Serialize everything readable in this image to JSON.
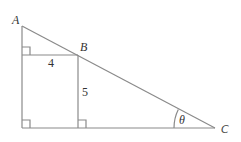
{
  "diagram": {
    "points": {
      "A": {
        "label": "A",
        "x": 22,
        "y": 26
      },
      "B": {
        "label": "B",
        "x": 78,
        "y": 55
      },
      "C": {
        "label": "C",
        "x": 215,
        "y": 128
      },
      "D": {
        "x": 22,
        "y": 128
      },
      "E": {
        "x": 22,
        "y": 55
      },
      "F": {
        "x": 78,
        "y": 128
      }
    },
    "labels": {
      "A": "A",
      "B": "B",
      "C": "C",
      "theta": "θ",
      "side_horizontal": "4",
      "side_vertical": "5"
    },
    "segments": [
      {
        "name": "AC-hypotenuse",
        "from": "A",
        "to": "C"
      },
      {
        "name": "A-to-bottom-left",
        "from": "A",
        "to": "D"
      },
      {
        "name": "base",
        "from": "D",
        "to": "C"
      },
      {
        "name": "rectangle-top",
        "from": "E",
        "to": "B"
      },
      {
        "name": "rectangle-right",
        "from": "B",
        "to": "F"
      }
    ],
    "right_angle_markers": [
      "top-left of rectangle",
      "bottom-left corner",
      "bottom of B vertical"
    ],
    "angle_marker": {
      "at": "C",
      "label": "θ"
    },
    "colors": {
      "line": "#8a8a8a",
      "text": "#333333"
    }
  }
}
